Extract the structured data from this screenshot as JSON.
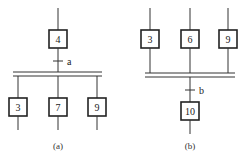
{
  "diagram_a": {
    "caption": "(a)",
    "top_step": "4",
    "transition": "a",
    "branch_steps": [
      "3",
      "7",
      "9"
    ]
  },
  "diagram_b": {
    "caption": "(b)",
    "branch_steps": [
      "3",
      "6",
      "9"
    ],
    "transition": "b",
    "bottom_step": "10"
  }
}
